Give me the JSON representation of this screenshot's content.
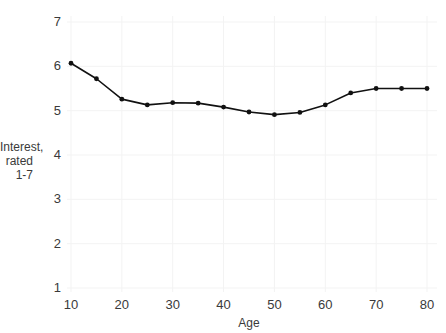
{
  "chart_data": {
    "type": "line",
    "title": "",
    "xlabel": "Age",
    "ylabel": "Interest, rated 1-7",
    "ylabel_line1": "Interest,",
    "ylabel_line2": "rated 1-7",
    "x": [
      10,
      15,
      20,
      25,
      30,
      35,
      40,
      45,
      50,
      55,
      60,
      65,
      70,
      75,
      80
    ],
    "values": [
      6.07,
      5.72,
      5.26,
      5.13,
      5.18,
      5.17,
      5.08,
      4.97,
      4.91,
      4.96,
      5.13,
      5.4,
      5.5,
      5.5,
      5.5
    ],
    "series": [
      {
        "name": "Interest",
        "values": [
          6.07,
          5.72,
          5.26,
          5.13,
          5.18,
          5.17,
          5.08,
          4.97,
          4.91,
          4.96,
          5.13,
          5.4,
          5.5,
          5.5,
          5.5
        ]
      }
    ],
    "xlim": [
      10,
      80
    ],
    "ylim": [
      1,
      7
    ],
    "xticks": [
      10,
      20,
      30,
      40,
      50,
      60,
      70,
      80
    ],
    "xtick_labels": [
      "10",
      "20",
      "30",
      "40",
      "50",
      "60",
      "70",
      "80"
    ],
    "yticks": [
      1,
      2,
      3,
      4,
      5,
      6,
      7
    ],
    "ytick_labels": [
      "1",
      "2",
      "3",
      "4",
      "5",
      "6",
      "7"
    ],
    "grid": true,
    "grid_color": "#f2f2f2",
    "legend": "none",
    "line_color": "#111111",
    "marker": "circle",
    "marker_color": "#111111"
  },
  "axis": {
    "y_labels": [
      "7",
      "6",
      "5",
      "4",
      "3",
      "2",
      "1"
    ],
    "x_labels": [
      "10",
      "20",
      "30",
      "40",
      "50",
      "60",
      "70",
      "80"
    ],
    "x_title": "Age",
    "y_title_line1": "Interest,",
    "y_title_line2": "rated 1-7"
  }
}
